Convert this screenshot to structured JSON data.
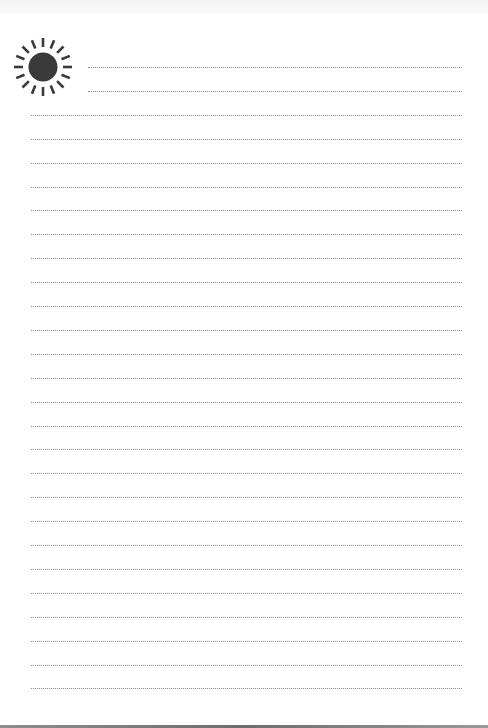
{
  "page": {
    "type": "lined-notepaper",
    "background": "#ffffff",
    "line_color": "#8a8a8a",
    "line_style": "dotted",
    "line_count": 27,
    "first_line_y": 67,
    "line_spacing": 23.9,
    "short_lines": 2,
    "short_line_left": 88,
    "full_line_left": 31,
    "line_right": 462
  },
  "decoration": {
    "icon": "sun-icon",
    "color": "#3a3a3a",
    "rays": 16
  }
}
